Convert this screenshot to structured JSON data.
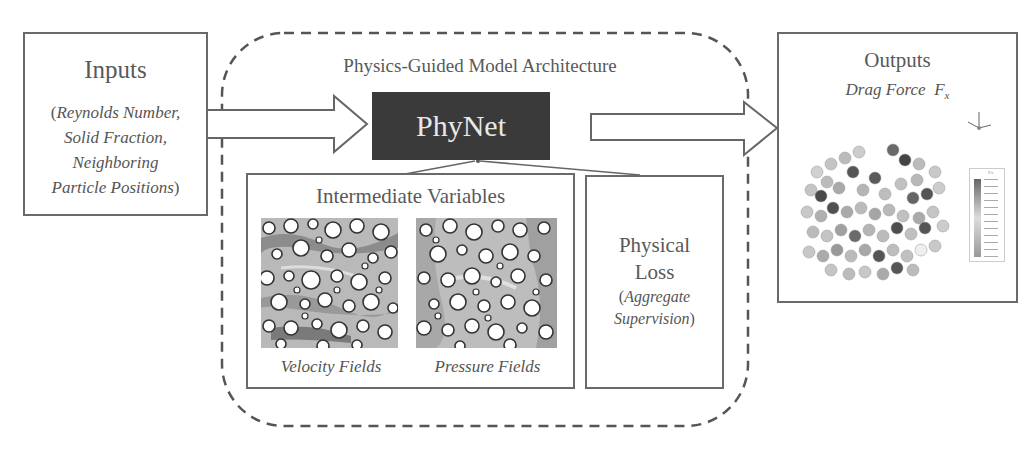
{
  "inputs": {
    "title": "Inputs",
    "open_paren": "(",
    "line1": "Reynolds Number,",
    "line2": "Solid Fraction,",
    "line3": "Neighboring",
    "line4": "Particle Positions",
    "close_paren": ")"
  },
  "architecture": {
    "label": "Physics-Guided Model Architecture",
    "model_name": "PhyNet",
    "intermediate": {
      "title": "Intermediate Variables",
      "fields": [
        {
          "label": "Velocity Fields"
        },
        {
          "label": "Pressure Fields"
        }
      ]
    },
    "loss": {
      "line1": "Physical",
      "line2": "Loss",
      "open_paren": "(",
      "line3": "Aggregate",
      "line4": "Supervision",
      "close_paren": ")"
    }
  },
  "outputs": {
    "title": "Outputs",
    "subtitle": "Drag Force",
    "symbol": "F",
    "subscript": "x",
    "colorbar_label": "Fx"
  },
  "colors": {
    "border": "#6a6a6a",
    "phynet_bg": "#3a3a3a",
    "phynet_text": "#e8e8e8",
    "text": "#555555"
  }
}
